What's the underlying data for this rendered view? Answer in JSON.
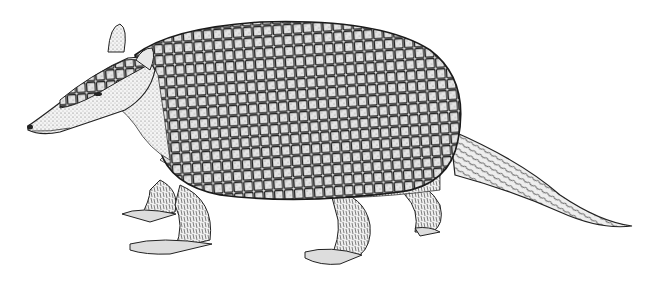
{
  "image": {
    "subject": "armadillo",
    "style": "pen-and-ink illustration",
    "background": "#ffffff",
    "ink": "#1a1a1a",
    "orientation": "facing left, walking"
  }
}
